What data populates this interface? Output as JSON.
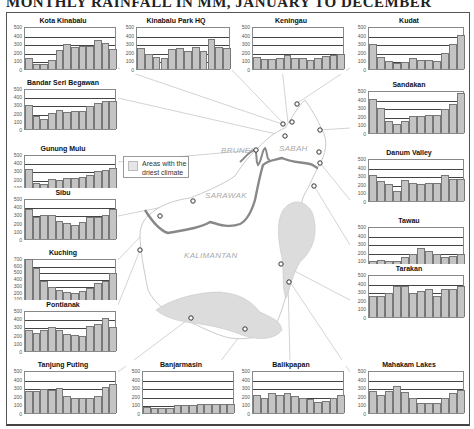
{
  "title": "MONTHLY RAINFALL IN MM, JANUARY TO DECEMBER",
  "legend": {
    "label": "Areas with the driest climate",
    "line1": "Areas with the",
    "line2": "driest climate",
    "swatch_color": "#e6e6e6"
  },
  "map_labels": {
    "brunei": "BRUNEI",
    "sabah": "SABAH",
    "sarawak": "SARAWAK",
    "kalimantan": "KALIMANTAN"
  },
  "colors": {
    "bar_fill": "#c4c4c4",
    "bar_stroke": "#777777",
    "border_line": "#8a8a8a",
    "dry_area": "#dcdcdc"
  },
  "y_ticks_500": [
    "500",
    "400",
    "300",
    "200",
    "100",
    "0"
  ],
  "y_ticks_700": [
    "700",
    "600",
    "500",
    "400",
    "300",
    "200",
    "100",
    "0"
  ],
  "chart_data": [
    {
      "type": "bar",
      "title": "Kota Kinabalu",
      "categories": [
        "Jan",
        "Feb",
        "Mar",
        "Apr",
        "May",
        "Jun",
        "Jul",
        "Aug",
        "Sep",
        "Oct",
        "Nov",
        "Dec"
      ],
      "values": [
        125,
        60,
        60,
        110,
        225,
        295,
        255,
        265,
        265,
        340,
        300,
        230
      ],
      "ylim": [
        0,
        500
      ],
      "xlabel": "",
      "ylabel": "mm"
    },
    {
      "type": "bar",
      "title": "Kinabalu Park HQ",
      "categories": [
        "Jan",
        "Feb",
        "Mar",
        "Apr",
        "May",
        "Jun",
        "Jul",
        "Aug",
        "Sep",
        "Oct",
        "Nov",
        "Dec"
      ],
      "values": [
        250,
        170,
        140,
        130,
        230,
        250,
        215,
        260,
        215,
        345,
        260,
        240
      ],
      "ylim": [
        0,
        500
      ],
      "xlabel": "",
      "ylabel": "mm"
    },
    {
      "type": "bar",
      "title": "Keningau",
      "categories": [
        "Jan",
        "Feb",
        "Mar",
        "Apr",
        "May",
        "Jun",
        "Jul",
        "Aug",
        "Sep",
        "Oct",
        "Nov",
        "Dec"
      ],
      "values": [
        135,
        115,
        115,
        125,
        165,
        125,
        125,
        110,
        125,
        150,
        165,
        175
      ],
      "ylim": [
        0,
        500
      ],
      "xlabel": "",
      "ylabel": "mm"
    },
    {
      "type": "bar",
      "title": "Kudat",
      "categories": [
        "Jan",
        "Feb",
        "Mar",
        "Apr",
        "May",
        "Jun",
        "Jul",
        "Aug",
        "Sep",
        "Oct",
        "Nov",
        "Dec"
      ],
      "values": [
        290,
        135,
        95,
        70,
        80,
        125,
        100,
        100,
        95,
        185,
        295,
        400
      ],
      "ylim": [
        0,
        500
      ],
      "xlabel": "",
      "ylabel": "mm"
    },
    {
      "type": "bar",
      "title": "Bandar Seri Begawan",
      "categories": [
        "Jan",
        "Feb",
        "Mar",
        "Apr",
        "May",
        "Jun",
        "Jul",
        "Aug",
        "Sep",
        "Oct",
        "Nov",
        "Dec"
      ],
      "values": [
        290,
        155,
        120,
        195,
        235,
        210,
        225,
        225,
        275,
        320,
        340,
        340
      ],
      "ylim": [
        0,
        500
      ],
      "xlabel": "",
      "ylabel": "mm"
    },
    {
      "type": "bar",
      "title": "Sandakan",
      "categories": [
        "Jan",
        "Feb",
        "Mar",
        "Apr",
        "May",
        "Jun",
        "Jul",
        "Aug",
        "Sep",
        "Oct",
        "Nov",
        "Dec"
      ],
      "values": [
        395,
        295,
        145,
        110,
        135,
        195,
        200,
        215,
        215,
        275,
        335,
        460
      ],
      "ylim": [
        0,
        500
      ],
      "xlabel": "",
      "ylabel": "mm"
    },
    {
      "type": "bar",
      "title": "Gunung Mulu",
      "categories": [
        "Jan",
        "Feb",
        "Mar",
        "Apr",
        "May",
        "Jun",
        "Jul",
        "Aug",
        "Sep",
        "Oct",
        "Nov",
        "Dec"
      ],
      "values": [
        320,
        150,
        135,
        195,
        185,
        210,
        205,
        215,
        240,
        295,
        310,
        335
      ],
      "ylim": [
        0,
        500
      ],
      "xlabel": "",
      "ylabel": "mm"
    },
    {
      "type": "bar",
      "title": "Danum Valley",
      "categories": [
        "Jan",
        "Feb",
        "Mar",
        "Apr",
        "May",
        "Jun",
        "Jul",
        "Aug",
        "Sep",
        "Oct",
        "Nov",
        "Dec"
      ],
      "values": [
        300,
        230,
        200,
        115,
        240,
        215,
        195,
        205,
        205,
        305,
        255,
        255
      ],
      "ylim": [
        0,
        500
      ],
      "xlabel": "",
      "ylabel": "mm"
    },
    {
      "type": "bar",
      "title": "Sibu",
      "categories": [
        "Jan",
        "Feb",
        "Mar",
        "Apr",
        "May",
        "Jun",
        "Jul",
        "Aug",
        "Sep",
        "Oct",
        "Nov",
        "Dec"
      ],
      "values": [
        370,
        270,
        290,
        290,
        225,
        190,
        165,
        210,
        270,
        270,
        295,
        360
      ],
      "ylim": [
        0,
        500
      ],
      "xlabel": "",
      "ylabel": "mm"
    },
    {
      "type": "bar",
      "title": "Tawau",
      "categories": [
        "Jan",
        "Feb",
        "Mar",
        "Apr",
        "May",
        "Jun",
        "Jul",
        "Aug",
        "Sep",
        "Oct",
        "Nov",
        "Dec"
      ],
      "values": [
        95,
        110,
        95,
        90,
        135,
        170,
        240,
        205,
        170,
        145,
        155,
        170
      ],
      "ylim": [
        0,
        500
      ],
      "xlabel": "",
      "ylabel": "mm"
    },
    {
      "type": "bar",
      "title": "Kuching",
      "categories": [
        "Jan",
        "Feb",
        "Mar",
        "Apr",
        "May",
        "Jun",
        "Jul",
        "Aug",
        "Sep",
        "Oct",
        "Nov",
        "Dec"
      ],
      "values": [
        690,
        545,
        365,
        270,
        230,
        200,
        175,
        215,
        260,
        335,
        360,
        480
      ],
      "ylim": [
        0,
        700
      ],
      "xlabel": "",
      "ylabel": "mm"
    },
    {
      "type": "bar",
      "title": "Tarakan",
      "categories": [
        "Jan",
        "Feb",
        "Mar",
        "Apr",
        "May",
        "Jun",
        "Jul",
        "Aug",
        "Sep",
        "Oct",
        "Nov",
        "Dec"
      ],
      "values": [
        250,
        250,
        275,
        365,
        360,
        275,
        300,
        330,
        250,
        320,
        330,
        365
      ],
      "ylim": [
        0,
        500
      ],
      "xlabel": "",
      "ylabel": "mm"
    },
    {
      "type": "bar",
      "title": "Pontianak",
      "categories": [
        "Jan",
        "Feb",
        "Mar",
        "Apr",
        "May",
        "Jun",
        "Jul",
        "Aug",
        "Sep",
        "Oct",
        "Nov",
        "Dec"
      ],
      "values": [
        260,
        220,
        255,
        295,
        255,
        210,
        200,
        185,
        300,
        330,
        400,
        295
      ],
      "ylim": [
        0,
        500
      ],
      "xlabel": "",
      "ylabel": "mm"
    },
    {
      "type": "bar",
      "title": "Tanjung Puting",
      "categories": [
        "Jan",
        "Feb",
        "Mar",
        "Apr",
        "May",
        "Jun",
        "Jul",
        "Aug",
        "Sep",
        "Oct",
        "Nov",
        "Dec"
      ],
      "values": [
        255,
        260,
        280,
        270,
        295,
        195,
        170,
        170,
        175,
        195,
        300,
        340
      ],
      "ylim": [
        0,
        500
      ],
      "xlabel": "",
      "ylabel": "mm"
    },
    {
      "type": "bar",
      "title": "Banjarmasin",
      "categories": [
        "Jan",
        "Feb",
        "Mar",
        "Apr",
        "May",
        "Jun",
        "Jul",
        "Aug",
        "Sep",
        "Oct",
        "Nov",
        "Dec"
      ],
      "values": [
        70,
        60,
        60,
        55,
        90,
        95,
        95,
        100,
        100,
        100,
        110,
        100
      ],
      "ylim": [
        0,
        500
      ],
      "xlabel": "",
      "ylabel": "mm"
    },
    {
      "type": "bar",
      "title": "Balikpapan",
      "categories": [
        "Jan",
        "Feb",
        "Mar",
        "Apr",
        "May",
        "Jun",
        "Jul",
        "Aug",
        "Sep",
        "Oct",
        "Nov",
        "Dec"
      ],
      "values": [
        205,
        175,
        230,
        205,
        230,
        195,
        180,
        165,
        130,
        135,
        170,
        205
      ],
      "ylim": [
        0,
        500
      ],
      "xlabel": "",
      "ylabel": "mm"
    },
    {
      "type": "bar",
      "title": "Mahakam Lakes",
      "categories": [
        "Jan",
        "Feb",
        "Mar",
        "Apr",
        "May",
        "Jun",
        "Jul",
        "Aug",
        "Sep",
        "Oct",
        "Nov",
        "Dec"
      ],
      "values": [
        260,
        210,
        255,
        310,
        250,
        180,
        115,
        120,
        120,
        175,
        235,
        270
      ],
      "ylim": [
        0,
        500
      ],
      "xlabel": "",
      "ylabel": "mm"
    }
  ]
}
